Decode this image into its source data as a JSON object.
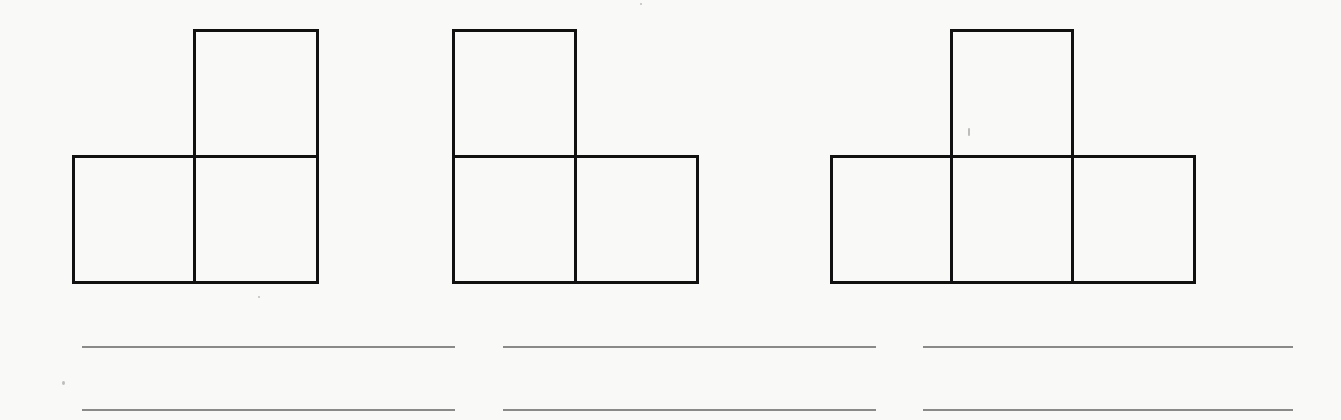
{
  "worksheet": {
    "type": "polyomino shapes with answer lines",
    "cell_size_px": 122,
    "line_color": "#111111",
    "answer_line_color": "#8a8a8a",
    "background_color": "#f9f9f8",
    "shapes": [
      {
        "id": "shape-1",
        "description": "L-shaped figure of 3 squares: one square on top right, two squares on bottom row",
        "square_count": 3,
        "origin": {
          "x": 72,
          "y": 29
        },
        "cells": [
          {
            "col": 1,
            "row": 0
          },
          {
            "col": 0,
            "row": 1
          },
          {
            "col": 1,
            "row": 1
          }
        ]
      },
      {
        "id": "shape-2",
        "description": "L-shaped figure of 3 squares: one square on top left, two squares on bottom row",
        "square_count": 3,
        "origin": {
          "x": 452,
          "y": 29
        },
        "cells": [
          {
            "col": 0,
            "row": 0
          },
          {
            "col": 0,
            "row": 1
          },
          {
            "col": 1,
            "row": 1
          }
        ]
      },
      {
        "id": "shape-3",
        "description": "T-shaped figure of 4 squares: one square on top center, three squares on bottom row",
        "square_count": 4,
        "origin": {
          "x": 830,
          "y": 29
        },
        "cells": [
          {
            "col": 1,
            "row": 0
          },
          {
            "col": 0,
            "row": 1
          },
          {
            "col": 1,
            "row": 1
          },
          {
            "col": 2,
            "row": 1
          }
        ]
      }
    ],
    "answer_lines": [
      {
        "x": 82,
        "y": 346,
        "width": 373
      },
      {
        "x": 503,
        "y": 346,
        "width": 373
      },
      {
        "x": 923,
        "y": 346,
        "width": 370
      },
      {
        "x": 82,
        "y": 409,
        "width": 373
      },
      {
        "x": 503,
        "y": 409,
        "width": 373
      },
      {
        "x": 923,
        "y": 409,
        "width": 370
      }
    ]
  }
}
